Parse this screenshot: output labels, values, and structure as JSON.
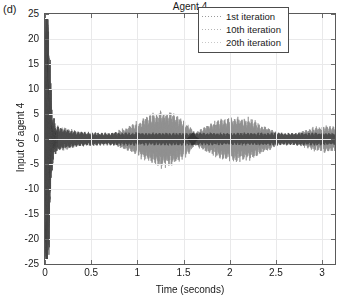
{
  "figure": {
    "panel_label": "(d)",
    "title": "Agent 4",
    "background_color": "#ffffff",
    "frame_color": "#5a5a5a",
    "grid_color": "#e9e9ea"
  },
  "axes": {
    "x": {
      "label": "Time (seconds)",
      "ticks": [
        "0",
        "0.5",
        "1",
        "1.5",
        "2",
        "2.5",
        "3"
      ],
      "tick_values": [
        0,
        0.5,
        1,
        1.5,
        2,
        2.5,
        3
      ],
      "min": 0,
      "max": 3.14
    },
    "y": {
      "label": "Input of agent 4",
      "ticks": [
        "25",
        "20",
        "15",
        "10",
        "5",
        "0",
        "-5",
        "-10",
        "-15",
        "-20",
        "-25"
      ],
      "tick_values": [
        25,
        20,
        15,
        10,
        5,
        0,
        -5,
        -10,
        -15,
        -20,
        -25
      ],
      "min": -25,
      "max": 25
    }
  },
  "legend": {
    "position": "top-right",
    "items": [
      {
        "label": "1st iteration",
        "style": "dotted",
        "color": "#9a9a9a"
      },
      {
        "label": "10th iteration",
        "style": "dotted",
        "color": "#b4b4b4"
      },
      {
        "label": "20th iteration",
        "style": "dotted",
        "color": "#c8c8c8"
      }
    ]
  },
  "chart_data": {
    "type": "line",
    "title": "Agent 4",
    "xlabel": "Time (seconds)",
    "ylabel": "Input of agent 4",
    "xlim": [
      0,
      3.14
    ],
    "ylim": [
      -25,
      25
    ],
    "grid": true,
    "legend_position": "top-right",
    "annotation": "(d)",
    "series": [
      {
        "name": "1st iteration",
        "color": "#4a4a4a",
        "style": "dotted",
        "envelope_x": [
          0.0,
          0.02,
          0.04,
          0.06,
          0.08,
          0.12,
          0.2,
          0.35,
          0.6,
          1.0,
          1.6,
          2.2,
          2.8,
          3.14
        ],
        "envelope_y": [
          2.0,
          20.0,
          21.0,
          12.0,
          5.0,
          2.2,
          1.6,
          1.2,
          1.0,
          1.0,
          1.0,
          1.0,
          1.0,
          1.0
        ],
        "transient": {
          "t": 0.04,
          "y_max": 21.0,
          "y_min": -21.0
        }
      },
      {
        "name": "10th iteration",
        "color": "#8f8f8f",
        "style": "dotted",
        "envelope_x": [
          0.0,
          0.05,
          0.1,
          0.2,
          0.35,
          0.5,
          0.7,
          0.9,
          1.1,
          1.25,
          1.4,
          1.55,
          1.62,
          1.75,
          1.9,
          2.05,
          2.2,
          2.4,
          2.55,
          2.7,
          2.9,
          3.05,
          3.14
        ],
        "envelope_y": [
          1.0,
          1.8,
          2.0,
          1.9,
          1.2,
          0.7,
          0.8,
          2.0,
          3.6,
          4.6,
          4.2,
          2.6,
          1.0,
          2.2,
          3.2,
          3.6,
          3.4,
          2.0,
          0.8,
          0.9,
          1.8,
          2.2,
          2.0
        ]
      },
      {
        "name": "20th iteration",
        "color": "#a8a8a8",
        "style": "dotted",
        "envelope_x": [
          0.0,
          0.05,
          0.1,
          0.2,
          0.35,
          0.5,
          0.7,
          0.9,
          1.1,
          1.25,
          1.4,
          1.55,
          1.62,
          1.75,
          1.9,
          2.05,
          2.2,
          2.4,
          2.55,
          2.7,
          2.9,
          3.05,
          3.14
        ],
        "envelope_y": [
          1.0,
          1.6,
          1.9,
          1.8,
          1.1,
          0.6,
          0.7,
          1.8,
          3.3,
          4.3,
          3.9,
          2.4,
          0.9,
          2.0,
          3.0,
          3.4,
          3.1,
          1.8,
          0.7,
          0.8,
          1.6,
          2.0,
          1.8
        ]
      }
    ],
    "oscillation_frequency_hz": 160
  }
}
